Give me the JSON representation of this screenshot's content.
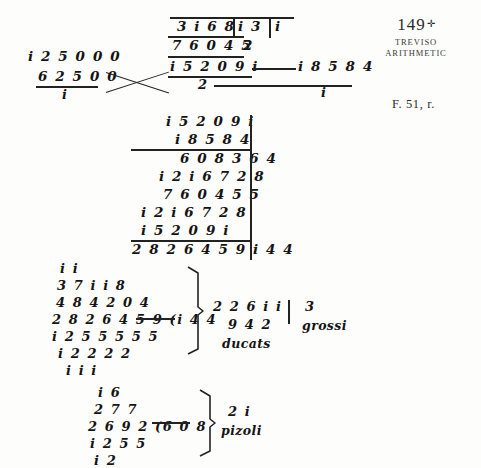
{
  "header": {
    "folio_number": "149",
    "folio_mark": "✛",
    "title_line1": "TREVISO",
    "title_line2": "ARITHMETIC",
    "caption": "F. 51, r."
  },
  "division_top": {
    "dividend_row": "3 i 6 8",
    "divisor_a": "i 3",
    "divisor_b": "i",
    "second_row": "7 6 0 4 5",
    "quotient_small": "2",
    "left_upper": "i 2 5 0 0 0",
    "left_lower": "6 2 5 0 0",
    "left_result": "i",
    "center_result": "i 5 2 0 9 i",
    "center_under": "2",
    "right_result": "i 8 5 8 4",
    "right_under": "i"
  },
  "multiplication": {
    "multiplicand": "i 5 2 0 9 i",
    "multiplier": "i 8 5 8 4",
    "partials": [
      "6 0 8 3 6 4",
      "i 2 i 6 7 2 8",
      "7 6 0 4 5 5",
      "i 2 i 6 7 2 8",
      "i 5 2 0 9 i"
    ],
    "product": "2 8 2 6 4 5 9 i 4 4"
  },
  "ducats_block": {
    "lines": [
      "i i",
      "3 7 i i 8",
      "4 8 4 2 0 4",
      "2 8 2 6 4 5 9 (i 4 4",
      "i 2 5 5 5 5 5",
      "i 2 2 2 2",
      "i i i"
    ],
    "result_line1": "2 2 6 i i",
    "result_line2": "9 4 2",
    "result_label": "ducats",
    "remainder_value": "3",
    "remainder_label": "grossi"
  },
  "pizoli_block": {
    "lines": [
      "i 6",
      "2 7 7",
      "2 6 9 2 (6 0 8",
      "i 2 5 5",
      "i 2"
    ],
    "result_value": "2 i",
    "result_label": "pizoli"
  }
}
